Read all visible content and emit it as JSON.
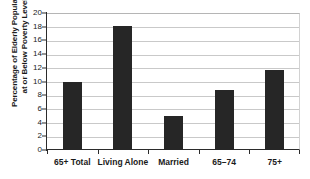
{
  "chart_data": {
    "type": "bar",
    "title": "",
    "subtitle": "",
    "xlabel": "",
    "ylabel": "Percentage of Elderly Population at or Below Poverty Level",
    "ylabel_lines": [
      "Percentage of Elderly Population",
      "at or Below Poverty Level"
    ],
    "categories": [
      "65+ Total",
      "Living Alone",
      "Married",
      "65–74",
      "75+"
    ],
    "values": [
      10.0,
      18.1,
      5.0,
      8.7,
      11.7
    ],
    "ylim": [
      0,
      20
    ],
    "ytick_step": 2,
    "yticks": [
      20,
      18,
      16,
      14,
      12,
      10,
      8,
      6,
      4,
      2,
      0
    ],
    "ytick_labels": [
      "20",
      "18",
      "16",
      "14",
      "12",
      "10",
      "8",
      "6",
      "4",
      "2",
      "0"
    ],
    "grid": true,
    "grid_axis": "y",
    "legend": false,
    "legend_position": "none",
    "bar_color": "#262626",
    "gridline_color": "#c9c9c9",
    "axis_color": "#2b2b2b",
    "background_color": "#ffffff"
  }
}
